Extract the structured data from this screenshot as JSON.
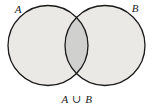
{
  "figure": {
    "kind": "venn-diagram",
    "caption": "A ∪ B",
    "caption_parts": {
      "left_set": "A",
      "operator": "∪",
      "right_set": "B"
    },
    "background_color": "#ffffff"
  },
  "sets": [
    {
      "id": "set-a",
      "label": "A",
      "label_position": "top-left-outside",
      "center_x": 48,
      "center_y": 45.5,
      "radius": 40,
      "label_x": 18,
      "label_y": 13
    },
    {
      "id": "set-b",
      "label": "B",
      "label_position": "top-right-outside",
      "center_x": 105,
      "center_y": 45.5,
      "radius": 40,
      "label_x": 135,
      "label_y": 12
    }
  ],
  "regions": {
    "circle_fill": "#eae9e6",
    "intersection_fill": "#d0d0cf",
    "outline_color": "#1a1a1a",
    "outline_width": 1.3,
    "shaded_description": "Entire area of both circles is shaded, representing the union",
    "intersection_top_point_x": 76,
    "intersection_top_point_y": 23,
    "intersection_bottom_point_x": 76,
    "intersection_bottom_point_y": 70
  },
  "caption_layout": {
    "center_x": 77,
    "baseline_y": 103
  }
}
